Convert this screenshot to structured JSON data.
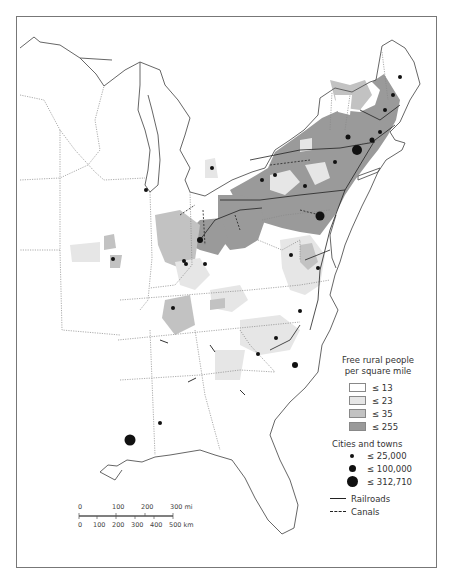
{
  "map": {
    "region": "Eastern United States",
    "subject": "Free rural population density with cities, railroads and canals"
  },
  "legend": {
    "density_title_line1": "Free rural people",
    "density_title_line2": "per square mile",
    "density_classes": [
      {
        "label": "≤ 13",
        "color": "#ffffff"
      },
      {
        "label": "≤ 23",
        "color": "#e6e6e6"
      },
      {
        "label": "≤ 35",
        "color": "#c2c2c2"
      },
      {
        "label": "≤ 255",
        "color": "#9a9a9a"
      }
    ],
    "cities_title": "Cities and towns",
    "city_classes": [
      {
        "label": "≤ 25,000",
        "size": 4
      },
      {
        "label": "≤ 100,000",
        "size": 7
      },
      {
        "label": "≤ 312,710",
        "size": 11
      }
    ],
    "lines": [
      {
        "label": "Railroads",
        "style": "solid"
      },
      {
        "label": "Canals",
        "style": "dashed"
      }
    ]
  },
  "scale_bar": {
    "miles_ticks": [
      "0",
      "100",
      "200",
      "300 mi"
    ],
    "km_ticks": [
      "0",
      "100",
      "200",
      "300",
      "400",
      "500 km"
    ]
  },
  "colors": {
    "frame": "#777777",
    "coast": "#555555",
    "state_border": "#888888",
    "class1": "#ffffff",
    "class2": "#e6e6e6",
    "class3": "#c2c2c2",
    "class4": "#9a9a9a",
    "city": "#111111"
  }
}
